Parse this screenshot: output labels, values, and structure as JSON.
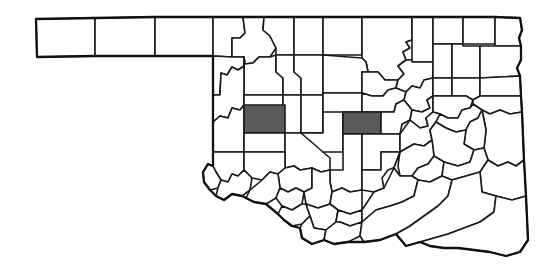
{
  "map": {
    "title": "Oklahoma county map",
    "state": "Oklahoma",
    "description": "Outline map of the state of Oklahoma divided into its 77 counties, with two counties filled in dark gray.",
    "background_color": "#ffffff",
    "county_fill_color": "#ffffff",
    "county_border_color": "#1a1a1a",
    "state_outline_color": "#111111",
    "highlight_fill_color": "#5a5a5a",
    "total_counties": 77,
    "highlighted_count": 2,
    "highlighted_counties": [
      {
        "name": "Custer",
        "region": "west-central",
        "fill": "#5a5a5a",
        "bbox": [
          244,
          105,
          41,
          28
        ]
      },
      {
        "name": "Oklahoma",
        "region": "central",
        "fill": "#5a5a5a",
        "bbox": [
          343,
          112,
          38,
          22
        ]
      }
    ],
    "features": {
      "panhandle_counties": 3,
      "panhandle_extent_x": [
        36,
        212
      ],
      "panhandle_extent_y": [
        17,
        57
      ],
      "map_extent_x": [
        36,
        536
      ],
      "map_extent_y": [
        17,
        258
      ],
      "legend_visible": false,
      "labels_visible": false,
      "scale_bar_visible": false,
      "north_arrow_visible": false
    }
  }
}
